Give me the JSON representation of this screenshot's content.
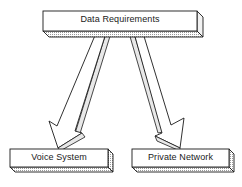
{
  "diagram": {
    "type": "hierarchy",
    "nodes": {
      "root": {
        "label": "Data Requirements"
      },
      "left": {
        "label": "Voice System"
      },
      "right": {
        "label": "Private Network"
      }
    },
    "edges": [
      {
        "from": "Data Requirements",
        "to": "Voice System",
        "style": "3d-arrow"
      },
      {
        "from": "Data Requirements",
        "to": "Private Network",
        "style": "3d-arrow"
      }
    ],
    "colors": {
      "stroke": "#1a1a1a",
      "fill": "#ffffff",
      "shade": "#d8d8d8"
    }
  }
}
